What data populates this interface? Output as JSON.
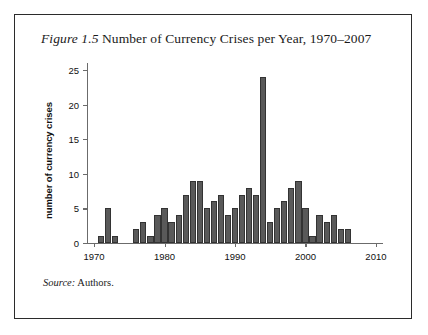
{
  "figure": {
    "number_label": "Figure 1.5",
    "title_text": " Number of Currency Crises per Year, 1970–2007",
    "source_label": "Source:",
    "source_text": " Authors."
  },
  "colors": {
    "bar_fill": "#595959",
    "bar_stroke": "#333333",
    "axis": "#6b6b6b",
    "frame": "#2b2b2b",
    "text": "#1a1a1a"
  },
  "chart_data": {
    "type": "bar",
    "title": "Figure 1.5 Number of Currency Crises per Year, 1970–2007",
    "xlabel": "",
    "ylabel": "number of currency crises",
    "xlim": [
      1969,
      2011
    ],
    "ylim": [
      0,
      26
    ],
    "grid": false,
    "legend": "none",
    "ytick_labels": [
      "0",
      "5",
      "10",
      "15",
      "20",
      "25"
    ],
    "yticks": [
      0,
      5,
      10,
      15,
      20,
      25
    ],
    "xtick_labels": [
      "1970",
      "1980",
      "1990",
      "2000",
      "2010"
    ],
    "xticks": [
      1970,
      1980,
      1990,
      2000,
      2010
    ],
    "categories": [
      1970,
      1971,
      1972,
      1973,
      1974,
      1975,
      1976,
      1977,
      1978,
      1979,
      1980,
      1981,
      1982,
      1983,
      1984,
      1985,
      1986,
      1987,
      1988,
      1989,
      1990,
      1991,
      1992,
      1993,
      1994,
      1995,
      1996,
      1997,
      1998,
      1999,
      2000,
      2001,
      2002,
      2003,
      2004,
      2005,
      2006,
      2007
    ],
    "values": [
      0,
      1,
      5,
      1,
      0,
      0,
      2,
      3,
      1,
      4,
      5,
      3,
      4,
      7,
      9,
      9,
      5,
      6,
      7,
      4,
      5,
      7,
      8,
      7,
      24,
      3,
      5,
      6,
      8,
      9,
      5,
      1,
      4,
      3,
      4,
      2,
      2,
      0
    ],
    "peak": {
      "year": 1994,
      "value": 24
    }
  }
}
